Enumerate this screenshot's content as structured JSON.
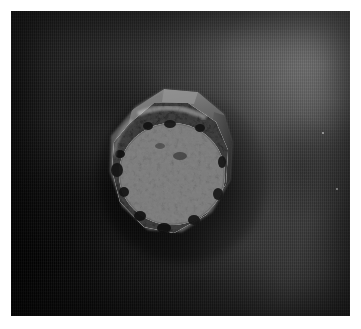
{
  "document": {
    "kind": "photograph",
    "title": "Mineral specimen photograph",
    "orientation": "landscape",
    "color_mode": "grayscale"
  },
  "canvas": {
    "width": 361,
    "height": 329,
    "paper_color": "#ffffff"
  },
  "photo": {
    "left": 11,
    "top": 11,
    "width": 339,
    "height": 305,
    "caption": "",
    "background_description": "dark woven cloth with fine vertical striations",
    "background_colors": {
      "darkest": "#0d0d0d",
      "mid": "#2c2c2c",
      "lightest": "#4d4d4d"
    },
    "lighting": "light falls from upper right, shadow deepens toward lower left"
  },
  "subject": {
    "name": "crystal-specimen",
    "description": "roughly hexagonal mineral crystal with a sparkling granular druzy crust covering a flat faceted top",
    "center_x": 180,
    "center_y": 165,
    "width": 156,
    "height": 162,
    "regions": [
      {
        "name": "upper-facet",
        "description": "smooth flat grey hexagonal crystal face along the top",
        "color": "#6f6f6f"
      },
      {
        "name": "right-facet",
        "description": "darker angled crystal facet on the right shoulder",
        "color": "#4a4a4a"
      },
      {
        "name": "druzy-crust",
        "description": "bright granular sparkling crust of tiny crystals covering the body",
        "color": "#d8d8d8"
      },
      {
        "name": "inner-disc",
        "description": "dense circular zone of the brightest white sparkles in the lower centre",
        "color": "#efefef"
      },
      {
        "name": "dark-pits",
        "description": "scattered black cavities and shadows along the crust and lower-left rim",
        "color": "#141414"
      }
    ]
  },
  "annotations": {
    "labels": [],
    "scale_bar": null,
    "text_present": false
  },
  "specks": [
    {
      "x": 322,
      "y": 132,
      "name": "background-speck-1"
    },
    {
      "x": 336,
      "y": 188,
      "name": "background-speck-2"
    }
  ]
}
